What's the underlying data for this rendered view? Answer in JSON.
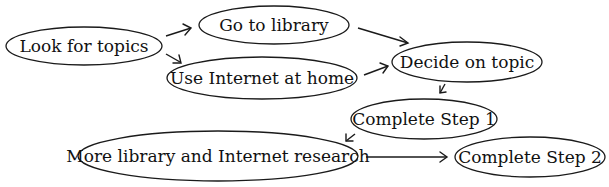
{
  "diagram": {
    "type": "flowchart",
    "nodes": [
      {
        "id": "look",
        "label": "Look for topics",
        "cx": 84,
        "cy": 46,
        "rx": 78,
        "ry": 19
      },
      {
        "id": "library",
        "label": "Go to library",
        "cx": 274,
        "cy": 25,
        "rx": 75,
        "ry": 19
      },
      {
        "id": "internet",
        "label": "Use Internet at home",
        "cx": 262,
        "cy": 78,
        "rx": 95,
        "ry": 21
      },
      {
        "id": "decide",
        "label": "Decide on topic",
        "cx": 467,
        "cy": 62,
        "rx": 75,
        "ry": 20
      },
      {
        "id": "step1",
        "label": "Complete Step 1",
        "cx": 424,
        "cy": 119,
        "rx": 73,
        "ry": 20
      },
      {
        "id": "more",
        "label": "More library and Internet research",
        "cx": 218,
        "cy": 156,
        "rx": 140,
        "ry": 25
      },
      {
        "id": "step2",
        "label": "Complete Step 2",
        "cx": 530,
        "cy": 157,
        "rx": 75,
        "ry": 20
      }
    ],
    "edges": [
      {
        "from": "look",
        "to": "library"
      },
      {
        "from": "look",
        "to": "internet"
      },
      {
        "from": "library",
        "to": "decide"
      },
      {
        "from": "internet",
        "to": "decide"
      },
      {
        "from": "decide",
        "to": "step1"
      },
      {
        "from": "step1",
        "to": "more"
      },
      {
        "from": "more",
        "to": "step2"
      }
    ]
  }
}
